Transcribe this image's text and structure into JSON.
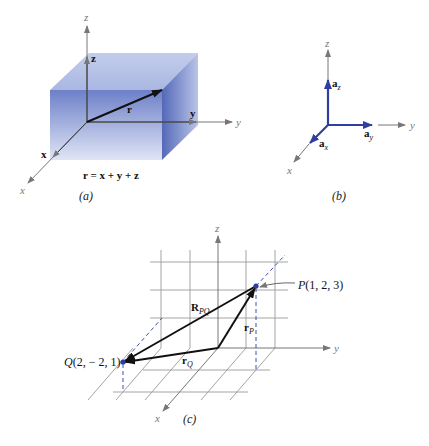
{
  "panels": {
    "a": {
      "caption": "(a)",
      "axes": {
        "x": "x",
        "y": "y",
        "z": "z"
      },
      "component_labels": {
        "x": "x",
        "y": "y",
        "z": "z"
      },
      "vector_label": "r",
      "equation": "r = x + y + z",
      "box_color": "#6f84cc"
    },
    "b": {
      "caption": "(b)",
      "axes": {
        "x": "x",
        "y": "y",
        "z": "z"
      },
      "unit_vectors": {
        "x": "a",
        "x_sub": "x",
        "y": "a",
        "y_sub": "y",
        "z": "a",
        "z_sub": "z"
      },
      "vector_color": "#2f3fa0"
    },
    "c": {
      "caption": "(c)",
      "axes": {
        "x": "x",
        "y": "y",
        "z": "z"
      },
      "point_P": {
        "name": "P",
        "coords": "(1, 2, 3)"
      },
      "point_Q": {
        "name": "Q",
        "coords": "(2, − 2, 1)"
      },
      "vector_RPQ": {
        "main": "R",
        "sub": "PQ"
      },
      "vector_rP": {
        "main": "r",
        "sub": "P"
      },
      "vector_rQ": {
        "main": "r",
        "sub": "Q"
      },
      "point_color": "#2f3fa0"
    }
  }
}
